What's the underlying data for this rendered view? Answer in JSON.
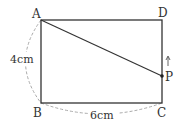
{
  "diagram": {
    "vertices": [
      {
        "id": "A",
        "label": "A",
        "x": 41,
        "y": 20
      },
      {
        "id": "D",
        "label": "D",
        "x": 162,
        "y": 20
      },
      {
        "id": "B",
        "label": "B",
        "x": 41,
        "y": 103
      },
      {
        "id": "C",
        "label": "C",
        "x": 162,
        "y": 103
      }
    ],
    "point_p": {
      "label": "P",
      "x": 162,
      "y": 76,
      "direction": "up"
    },
    "dimensions": {
      "height_label": "4cm",
      "width_label": "6cm"
    },
    "colors": {
      "line": "#333333",
      "dashed": "#aaaaaa",
      "text": "#333333"
    }
  }
}
